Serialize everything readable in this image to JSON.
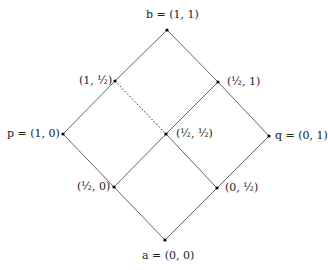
{
  "diagram": {
    "type": "lattice",
    "nodes": {
      "b": {
        "label": "b = (1, 1)",
        "x": 167,
        "y": 30
      },
      "one_half_left": {
        "label": "(1, ½)",
        "x": 115,
        "y": 81
      },
      "half_one_right": {
        "label": "(½, 1)",
        "x": 218,
        "y": 82
      },
      "p": {
        "label": "p = (1, 0)",
        "x": 63,
        "y": 134
      },
      "center": {
        "label": "(½, ½)",
        "x": 166,
        "y": 134
      },
      "q": {
        "label": "q = (0, 1)",
        "x": 269,
        "y": 136
      },
      "half_zero": {
        "label": "(½, 0)",
        "x": 114,
        "y": 187
      },
      "zero_half": {
        "label": "(0, ½)",
        "x": 217,
        "y": 188
      },
      "a": {
        "label": "a = (0, 0)",
        "x": 165,
        "y": 240
      }
    },
    "edges_solid": [
      [
        "b",
        "one_half_left"
      ],
      [
        "one_half_left",
        "p"
      ],
      [
        "b",
        "half_one_right"
      ],
      [
        "half_one_right",
        "q"
      ],
      [
        "p",
        "half_zero"
      ],
      [
        "half_zero",
        "a"
      ],
      [
        "q",
        "zero_half"
      ],
      [
        "zero_half",
        "a"
      ],
      [
        "half_one_right",
        "center"
      ],
      [
        "center",
        "half_zero"
      ],
      [
        "center",
        "zero_half"
      ]
    ],
    "edges_dotted": [
      [
        "one_half_left",
        "center"
      ]
    ],
    "colors": {
      "edge": "#555555",
      "node": "#000000",
      "text": "#222222"
    }
  }
}
